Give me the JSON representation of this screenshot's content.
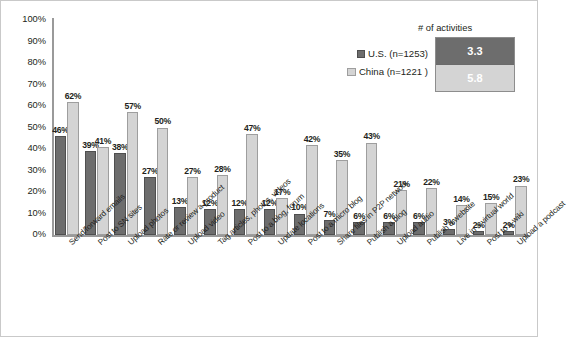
{
  "chart_data": {
    "type": "bar",
    "title": "",
    "xlabel": "",
    "ylabel": "",
    "ylim": [
      0,
      100
    ],
    "ytick_labels": [
      "100%",
      "90%",
      "80%",
      "70%",
      "60%",
      "50%",
      "40%",
      "30%",
      "20%",
      "10%",
      "0%"
    ],
    "ytick_values": [
      100,
      90,
      80,
      70,
      60,
      50,
      40,
      30,
      20,
      10,
      0
    ],
    "grid": false,
    "legend_position": "top-right",
    "value_suffix": "%",
    "categories": [
      "Send/forward emails",
      "Post to SN sites",
      "Upload photos",
      "Rate or review a product",
      "Upload video",
      "Tag articles, photos, videos",
      "Post to a blog, forum",
      "Update locations",
      "Post to a micro blog",
      "Share files in P2P network",
      "Publish a blog",
      "Upload audio",
      "Publish a website",
      "Live in a virtual world",
      "Post to a wiki",
      "Upload a podcast"
    ],
    "series": [
      {
        "name": "U.S. (n=1253)",
        "color": "#6d6d6d",
        "values": [
          46,
          39,
          38,
          27,
          13,
          12,
          12,
          12,
          10,
          7,
          6,
          6,
          6,
          3,
          2,
          2
        ],
        "labels": [
          "46%",
          "39%",
          "38%",
          "27%",
          "13%",
          "12%",
          "12%",
          "12%",
          "10%",
          "7%",
          "6%",
          "6%",
          "6%",
          "3%",
          "2%",
          "2%"
        ]
      },
      {
        "name": "China (n=1221 )",
        "color": "#d4d4d4",
        "values": [
          62,
          41,
          57,
          50,
          27,
          28,
          47,
          17,
          42,
          35,
          43,
          21,
          22,
          14,
          15,
          23
        ],
        "labels": [
          "62%",
          "41%",
          "57%",
          "50%",
          "27%",
          "28%",
          "47%",
          "17%",
          "42%",
          "35%",
          "43%",
          "21%",
          "22%",
          "14%",
          "15%",
          "23%"
        ]
      }
    ],
    "annotation_box": {
      "title": "# of activities",
      "rows": [
        {
          "series": "U.S. (n=1253)",
          "value": "3.3"
        },
        {
          "series": "China (n=1221 )",
          "value": "5.8"
        }
      ]
    }
  },
  "legend": {
    "entries": [
      {
        "label": "U.S. (n=1253)"
      },
      {
        "label": "China (n=1221 )"
      }
    ]
  },
  "colors": {
    "us_bar": "#6d6d6d",
    "china_bar": "#d4d4d4",
    "axis": "#9a9a9a",
    "text": "#231f20"
  }
}
